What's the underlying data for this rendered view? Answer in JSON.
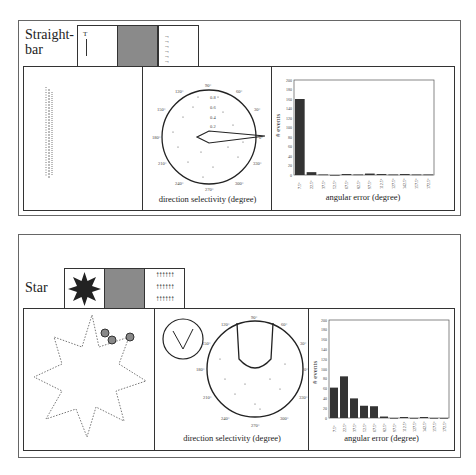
{
  "figure": {
    "rows": [
      {
        "label": "Straight-\nbar",
        "label_line1": "Straight-",
        "label_line2": "bar",
        "stimulus_tiles": [
          "bar-shape",
          "gray-field",
          "rightward-arrows"
        ],
        "polar_caption": "direction selectivity (degree)",
        "hist_caption": "angular error (degree)"
      },
      {
        "label": "Star",
        "stimulus_tiles": [
          "star-shape",
          "gray-field",
          "upward-arrows"
        ],
        "polar_caption": "direction selectivity (degree)",
        "hist_caption": "angular error (degree)"
      }
    ],
    "polar_angle_labels": [
      "90°",
      "60°",
      "30°",
      "0°",
      "330°",
      "300°",
      "270°",
      "240°",
      "210°",
      "180°",
      "150°",
      "120°"
    ],
    "polar_radial_labels": [
      "1",
      "0.8",
      "0.6",
      "0.4",
      "0.2"
    ],
    "hist_ylabel": "# events"
  },
  "chart_data": [
    {
      "type": "bar",
      "title": "Straight-bar: angular error histogram",
      "xlabel": "angular error (degree)",
      "ylabel": "# events",
      "ylim": [
        0,
        200
      ],
      "yticks": [
        0,
        20,
        40,
        60,
        80,
        100,
        120,
        140,
        160,
        180,
        200
      ],
      "categories": [
        "7.5°",
        "22.5°",
        "37.5°",
        "52.5°",
        "67.5°",
        "82.5°",
        "97.5°",
        "112.5°",
        "127.5°",
        "142.5°",
        "157.5°",
        "172.5°"
      ],
      "values": [
        160,
        6,
        1,
        0,
        2,
        1,
        3,
        2,
        1,
        2,
        1,
        1
      ]
    },
    {
      "type": "bar",
      "title": "Star: angular error histogram",
      "xlabel": "angular error (degree)",
      "ylabel": "# events",
      "ylim": [
        0,
        200
      ],
      "yticks": [
        0,
        20,
        40,
        60,
        80,
        100,
        120,
        140,
        160,
        180,
        200
      ],
      "categories": [
        "7.5°",
        "22.5°",
        "37.5°",
        "52.5°",
        "67.5°",
        "82.5°",
        "97.5°",
        "112.5°",
        "127.5°",
        "142.5°",
        "157.5°",
        "172.5°"
      ],
      "values": [
        62,
        85,
        40,
        25,
        24,
        3,
        0,
        2,
        0,
        2,
        0,
        0
      ]
    },
    {
      "type": "scatter",
      "title": "Straight-bar: direction selectivity (polar)",
      "xlabel": "direction selectivity (degree)",
      "preferred_direction_deg": 0,
      "rlim": [
        0,
        1
      ]
    },
    {
      "type": "scatter",
      "title": "Star: direction selectivity (polar)",
      "xlabel": "direction selectivity (degree)",
      "preferred_direction_deg": 90,
      "rlim": [
        0,
        1
      ]
    }
  ]
}
